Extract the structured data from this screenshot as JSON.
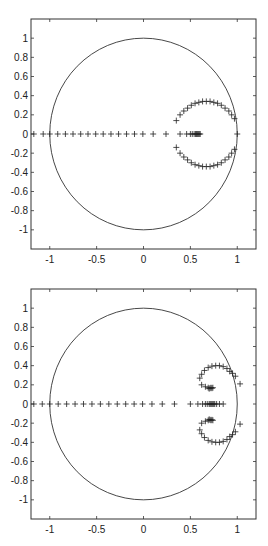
{
  "chart_data": [
    {
      "type": "scatter",
      "title": "",
      "xlabel": "",
      "ylabel": "",
      "xlim": [
        -1.2,
        1.2
      ],
      "ylim": [
        -1.2,
        1.2
      ],
      "grid": false,
      "legend": null,
      "x_ticks": [
        -1,
        -0.5,
        0,
        0.5,
        1
      ],
      "x_tick_labels": [
        "-1",
        "-0.5",
        "0",
        "0.5",
        "1"
      ],
      "y_ticks": [
        1,
        0.8,
        0.6,
        0.4,
        0.2,
        0,
        -0.2,
        -0.4,
        -0.6,
        -0.8,
        -1
      ],
      "y_tick_labels": [
        "1",
        "0.8",
        "0.6",
        "0.4",
        "0.2",
        "0",
        "-0.2",
        "-0.4",
        "-0.6",
        "-0.8",
        "-1"
      ],
      "annotations": [
        "unit circle"
      ],
      "series": [
        {
          "name": "unit circle",
          "kind": "line",
          "center": [
            0,
            0
          ],
          "radius": 1
        },
        {
          "name": "real-axis roots",
          "marker": "+",
          "points": [
            [
              -1.17,
              0
            ],
            [
              -1.07,
              0
            ],
            [
              -1.0,
              0
            ],
            [
              -0.915,
              0
            ],
            [
              -0.833,
              0
            ],
            [
              -0.752,
              0
            ],
            [
              -0.67,
              0
            ],
            [
              -0.592,
              0
            ],
            [
              -0.51,
              0
            ],
            [
              -0.43,
              0
            ],
            [
              -0.347,
              0
            ],
            [
              -0.266,
              0
            ],
            [
              -0.181,
              0
            ],
            [
              -0.096,
              0
            ],
            [
              -0.007,
              0
            ],
            [
              0.103,
              0
            ],
            [
              0.24,
              0
            ],
            [
              0.39,
              0
            ],
            [
              0.46,
              0
            ],
            [
              0.5,
              0
            ],
            [
              0.52,
              0
            ],
            [
              0.54,
              0
            ],
            [
              0.555,
              0
            ],
            [
              0.565,
              0
            ],
            [
              0.575,
              0
            ],
            [
              0.585,
              0
            ],
            [
              0.595,
              0
            ],
            [
              0.605,
              0
            ],
            [
              1.0,
              0
            ]
          ]
        },
        {
          "name": "upper arc",
          "marker": "+",
          "points": [
            [
              0.35,
              0.14
            ],
            [
              0.39,
              0.2
            ],
            [
              0.43,
              0.24
            ],
            [
              0.47,
              0.27
            ],
            [
              0.51,
              0.3
            ],
            [
              0.55,
              0.32
            ],
            [
              0.59,
              0.33
            ],
            [
              0.63,
              0.34
            ],
            [
              0.67,
              0.34
            ],
            [
              0.71,
              0.34
            ],
            [
              0.75,
              0.33
            ],
            [
              0.79,
              0.32
            ],
            [
              0.83,
              0.3
            ],
            [
              0.87,
              0.27
            ],
            [
              0.91,
              0.24
            ],
            [
              0.94,
              0.2
            ],
            [
              0.97,
              0.16
            ]
          ]
        },
        {
          "name": "lower arc",
          "marker": "+",
          "points": [
            [
              0.35,
              -0.14
            ],
            [
              0.39,
              -0.2
            ],
            [
              0.43,
              -0.24
            ],
            [
              0.47,
              -0.27
            ],
            [
              0.51,
              -0.3
            ],
            [
              0.55,
              -0.32
            ],
            [
              0.59,
              -0.33
            ],
            [
              0.63,
              -0.34
            ],
            [
              0.67,
              -0.34
            ],
            [
              0.71,
              -0.34
            ],
            [
              0.75,
              -0.33
            ],
            [
              0.79,
              -0.32
            ],
            [
              0.83,
              -0.3
            ],
            [
              0.87,
              -0.27
            ],
            [
              0.91,
              -0.24
            ],
            [
              0.94,
              -0.2
            ],
            [
              0.97,
              -0.16
            ]
          ]
        }
      ]
    },
    {
      "type": "scatter",
      "title": "",
      "xlabel": "",
      "ylabel": "",
      "xlim": [
        -1.2,
        1.2
      ],
      "ylim": [
        -1.2,
        1.2
      ],
      "grid": false,
      "legend": null,
      "x_ticks": [
        -1,
        -0.5,
        0,
        0.5,
        1
      ],
      "x_tick_labels": [
        "-1",
        "-0.5",
        "0",
        "0.5",
        "1"
      ],
      "y_ticks": [
        1,
        0.8,
        0.6,
        0.4,
        0.2,
        0,
        -0.2,
        -0.4,
        -0.6,
        -0.8,
        -1
      ],
      "y_tick_labels": [
        "1",
        "0.8",
        "0.6",
        "0.4",
        "0.2",
        "0",
        "-0.2",
        "-0.4",
        "-0.6",
        "-0.8",
        "-1"
      ],
      "annotations": [
        "unit circle"
      ],
      "series": [
        {
          "name": "unit circle",
          "kind": "line",
          "center": [
            0,
            0
          ],
          "radius": 1
        },
        {
          "name": "real-axis roots",
          "marker": "+",
          "points": [
            [
              -1.17,
              0
            ],
            [
              -1.08,
              0
            ],
            [
              -1.0,
              0
            ],
            [
              -0.91,
              0
            ],
            [
              -0.82,
              0
            ],
            [
              -0.73,
              0
            ],
            [
              -0.64,
              0
            ],
            [
              -0.55,
              0
            ],
            [
              -0.46,
              0
            ],
            [
              -0.37,
              0
            ],
            [
              -0.28,
              0
            ],
            [
              -0.19,
              0
            ],
            [
              -0.1,
              0
            ],
            [
              -0.01,
              0
            ],
            [
              0.09,
              0
            ],
            [
              0.2,
              0
            ],
            [
              0.33,
              0
            ],
            [
              0.5,
              0
            ],
            [
              0.58,
              0
            ],
            [
              0.63,
              0
            ],
            [
              0.66,
              0
            ],
            [
              0.68,
              0
            ],
            [
              0.7,
              0
            ],
            [
              0.71,
              0
            ],
            [
              0.72,
              0
            ],
            [
              0.73,
              0
            ],
            [
              0.74,
              0
            ],
            [
              0.75,
              0
            ],
            [
              0.76,
              0
            ],
            [
              0.78,
              0
            ],
            [
              0.81,
              0
            ],
            [
              0.85,
              0
            ]
          ]
        },
        {
          "name": "upper loop",
          "marker": "+",
          "points": [
            [
              0.72,
              0.17
            ],
            [
              0.71,
              0.165
            ],
            [
              0.7,
              0.16
            ],
            [
              0.73,
              0.165
            ],
            [
              0.74,
              0.17
            ],
            [
              0.69,
              0.17
            ],
            [
              0.66,
              0.18
            ],
            [
              0.62,
              0.2
            ],
            [
              0.6,
              0.27
            ],
            [
              0.62,
              0.31
            ],
            [
              0.65,
              0.35
            ],
            [
              0.69,
              0.38
            ],
            [
              0.73,
              0.395
            ],
            [
              0.77,
              0.4
            ],
            [
              0.81,
              0.4
            ],
            [
              0.85,
              0.39
            ],
            [
              0.89,
              0.37
            ],
            [
              0.92,
              0.34
            ],
            [
              0.95,
              0.32
            ],
            [
              0.98,
              0.29
            ],
            [
              1.03,
              0.21
            ]
          ]
        },
        {
          "name": "lower loop",
          "marker": "+",
          "points": [
            [
              0.72,
              -0.17
            ],
            [
              0.71,
              -0.165
            ],
            [
              0.7,
              -0.16
            ],
            [
              0.73,
              -0.165
            ],
            [
              0.74,
              -0.17
            ],
            [
              0.69,
              -0.17
            ],
            [
              0.66,
              -0.18
            ],
            [
              0.62,
              -0.2
            ],
            [
              0.6,
              -0.27
            ],
            [
              0.62,
              -0.31
            ],
            [
              0.65,
              -0.35
            ],
            [
              0.69,
              -0.38
            ],
            [
              0.73,
              -0.395
            ],
            [
              0.77,
              -0.4
            ],
            [
              0.81,
              -0.4
            ],
            [
              0.85,
              -0.39
            ],
            [
              0.89,
              -0.37
            ],
            [
              0.92,
              -0.34
            ],
            [
              0.95,
              -0.32
            ],
            [
              0.98,
              -0.29
            ],
            [
              1.03,
              -0.21
            ]
          ]
        }
      ]
    }
  ]
}
